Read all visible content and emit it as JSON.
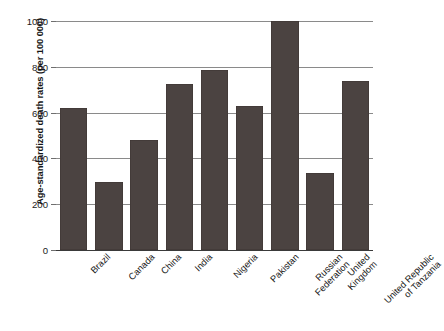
{
  "chart_data": {
    "type": "bar",
    "title": "",
    "xlabel": "",
    "ylabel": "Age-standardized death rates (per 100 000)",
    "ylim": [
      0,
      1000
    ],
    "ytick_labels": [
      "1000",
      "800",
      "600",
      "400",
      "200",
      "0"
    ],
    "yticks": [
      1000,
      800,
      600,
      400,
      200,
      0
    ],
    "grid": true,
    "legend": "none",
    "bar_color": "#4b4341",
    "categories": [
      "Brazil",
      "Canada",
      "China",
      "India",
      "Nigeria",
      "Pakistan",
      "Russian Federation",
      "United Kingdom",
      "United Republic of Tanzania"
    ],
    "category_lines": [
      [
        "Brazil"
      ],
      [
        "Canada"
      ],
      [
        "China"
      ],
      [
        "India"
      ],
      [
        "Nigeria"
      ],
      [
        "Pakistan"
      ],
      [
        "Russian",
        "Federation"
      ],
      [
        "United",
        "Kingdom"
      ],
      [
        "United Republic",
        "of Tanzania"
      ]
    ],
    "values": [
      620,
      298,
      480,
      725,
      785,
      628,
      1000,
      336,
      738
    ]
  }
}
